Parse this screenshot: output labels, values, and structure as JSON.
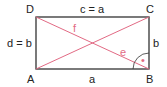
{
  "diagram": {
    "type": "rectangle-with-diagonals",
    "colors": {
      "edge": "#333333",
      "diagonal": "#e26a84"
    },
    "vertices": {
      "A": "A",
      "B": "B",
      "C": "C",
      "D": "D"
    },
    "sides": {
      "bottom": "a",
      "top": "c = a",
      "left": "d = b",
      "right": "b"
    },
    "diagonals": {
      "DB": "f",
      "AC": "e"
    },
    "angle_mark": "•"
  }
}
